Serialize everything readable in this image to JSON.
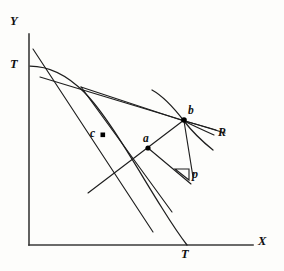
{
  "figure": {
    "kind": "economics-line-diagram",
    "background_color": "#fdfdfb",
    "ink_color": "#1e1e1e",
    "axes": {
      "y_axis_label": "Y",
      "x_axis_label": "X",
      "origin": {
        "x": 29,
        "y": 245
      },
      "y_top": 34,
      "x_right": 253
    },
    "labels": {
      "y_label": "Y",
      "x_label": "X",
      "t_intercept_y": "T",
      "t_intercept_x": "T",
      "point_a": "a",
      "point_b": "b",
      "point_c": "c",
      "ray_r": "R",
      "slope_p": "p"
    },
    "points": [
      {
        "name": "a",
        "label": "a",
        "x": 148,
        "y": 148,
        "dot": true
      },
      {
        "name": "b",
        "label": "b",
        "x": 184,
        "y": 120,
        "dot": true
      },
      {
        "name": "c",
        "label": "c",
        "x": 103,
        "y": 135,
        "dot": true
      }
    ],
    "curves": [
      {
        "name": "transformation-curve-TT",
        "endpoint_top": "T",
        "endpoint_bottom": "T"
      },
      {
        "name": "indifference-curve-through-b"
      },
      {
        "name": "price-line-through-a-and-b"
      },
      {
        "name": "ray-R"
      },
      {
        "name": "budget-line-steep"
      },
      {
        "name": "budget-line-shallow"
      }
    ],
    "slope_marker": {
      "label": "p",
      "x": 175,
      "y": 168,
      "width": 14,
      "height": 10
    }
  }
}
